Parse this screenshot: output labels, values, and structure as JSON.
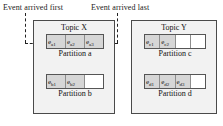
{
  "captions": {
    "first": "Event arrived first",
    "last": "Event arrived last"
  },
  "topics": [
    {
      "id": "topic-x",
      "title": "Topic X",
      "partitions": [
        {
          "id": "part-a",
          "label": "Partition a",
          "cell_count": 3,
          "events": [
            "e",
            "e",
            "e"
          ],
          "event_labels": [
            "ea1",
            "ea2",
            "ea3"
          ],
          "event_base": [
            "e",
            "e",
            "e"
          ],
          "event_sub": [
            "a1",
            "a2",
            "a3"
          ],
          "filled": [
            true,
            true,
            true
          ]
        },
        {
          "id": "part-b",
          "label": "Partition b",
          "cell_count": 3,
          "event_labels": [
            "eb1",
            "eb2"
          ],
          "event_base": [
            "e",
            "e"
          ],
          "event_sub": [
            "b1",
            "b2"
          ],
          "filled": [
            true,
            true,
            false
          ]
        }
      ]
    },
    {
      "id": "topic-y",
      "title": "Topic Y",
      "partitions": [
        {
          "id": "part-c",
          "label": "Partition c",
          "cell_count": 4,
          "event_labels": [
            "ec1",
            "ec2"
          ],
          "event_base": [
            "e",
            "e"
          ],
          "event_sub": [
            "c1",
            "c2"
          ],
          "filled": [
            true,
            true,
            false,
            false
          ]
        },
        {
          "id": "part-d",
          "label": "Partition d",
          "cell_count": 4,
          "event_labels": [
            "ed1",
            "ed2",
            "ed3"
          ],
          "event_base": [
            "e",
            "e",
            "e"
          ],
          "event_sub": [
            "d1",
            "d2",
            "d3"
          ],
          "filled": [
            true,
            true,
            true,
            false
          ]
        }
      ]
    }
  ],
  "colors": {
    "filled_cell": "#d6d6d6",
    "empty_cell": "#ffffff",
    "topic_bg": "#f2f2f2",
    "border": "#4a4a4a",
    "text": "#111111"
  }
}
